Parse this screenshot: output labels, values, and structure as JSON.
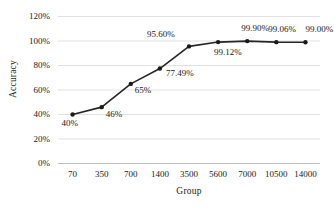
{
  "chart_data": {
    "type": "line",
    "title": "",
    "xlabel": "Group",
    "ylabel": "Accuracy",
    "categories": [
      "70",
      "350",
      "700",
      "1400",
      "3500",
      "5600",
      "7000",
      "10500",
      "14000"
    ],
    "values": [
      40,
      46,
      65,
      77.49,
      95.6,
      99.12,
      99.9,
      99.06,
      99.0
    ],
    "point_labels": [
      "40%",
      "46%",
      "65%",
      "77.49%",
      "95.60%",
      "99.12%",
      "99.90%",
      "99.06%",
      "99.00%"
    ],
    "ylim": [
      0,
      120
    ],
    "yticks": [
      "0%",
      "20%",
      "40%",
      "60%",
      "80%",
      "100%",
      "120%"
    ],
    "ytick_values": [
      0,
      20,
      40,
      60,
      80,
      100,
      120
    ],
    "grid": true,
    "legend": "none",
    "series_color": "#262626",
    "marker": "circle",
    "marker_color": "#1a1a1a",
    "grid_color": "#d9d9d9"
  },
  "labels": {
    "y_axis_title": "Accuracy",
    "x_axis_title": "Group"
  }
}
